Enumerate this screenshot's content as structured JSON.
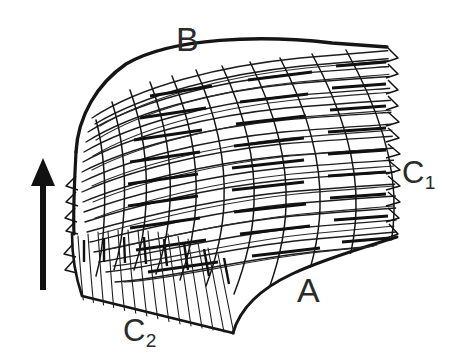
{
  "figure": {
    "background_color": "#ffffff",
    "ink_color": "#1a1a1a",
    "label_color": "#2b2b2b",
    "width": 451,
    "height": 364
  },
  "labels": {
    "b": "B",
    "a": "A",
    "c1_base": "C",
    "c1_sub": "1",
    "c2_base": "C",
    "c2_sub": "2"
  },
  "arrow": {
    "name": "direction-arrow",
    "orientation": "up",
    "color": "#111111",
    "x": 43,
    "tip_y": 158,
    "tail_y": 290,
    "shaft_width": 6,
    "head_width": 22,
    "head_height": 26
  },
  "regions": [
    {
      "key": "b",
      "label": "B",
      "description": "upper convex margin of bundle"
    },
    {
      "key": "a",
      "label": "A",
      "description": "lower concave margin, open white area"
    },
    {
      "key": "c1",
      "label": "C1",
      "description": "right serrated fiber tip margin"
    },
    {
      "key": "c2",
      "label": "C2",
      "description": "lower-left short vertical fiber zone"
    }
  ]
}
